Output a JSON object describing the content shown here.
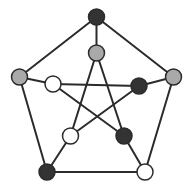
{
  "diagram": {
    "type": "graph",
    "name": "Petersen graph",
    "colors": {
      "edge": "#2b2b2b",
      "node_stroke": "#2b2b2b",
      "dark": "#333333",
      "gray": "#a9a9a9",
      "white": "#ffffff"
    },
    "node_radius": 8,
    "edge_width": 2,
    "nodes": [
      {
        "id": "outer-top",
        "x": 96.5,
        "y": 17,
        "fill": "dark"
      },
      {
        "id": "outer-right",
        "x": 173.5,
        "y": 77,
        "fill": "gray"
      },
      {
        "id": "outer-bottom-right",
        "x": 145,
        "y": 172,
        "fill": "white"
      },
      {
        "id": "outer-bottom-left",
        "x": 47,
        "y": 172,
        "fill": "dark"
      },
      {
        "id": "outer-left",
        "x": 19.5,
        "y": 77,
        "fill": "gray"
      },
      {
        "id": "inner-top",
        "x": 96.5,
        "y": 53,
        "fill": "gray"
      },
      {
        "id": "inner-right",
        "x": 139,
        "y": 86,
        "fill": "dark"
      },
      {
        "id": "inner-bottom-right",
        "x": 124,
        "y": 136,
        "fill": "dark"
      },
      {
        "id": "inner-bottom-left",
        "x": 70.5,
        "y": 136,
        "fill": "white"
      },
      {
        "id": "inner-left",
        "x": 53,
        "y": 84,
        "fill": "white"
      }
    ],
    "edges": [
      [
        "outer-top",
        "outer-right"
      ],
      [
        "outer-right",
        "outer-bottom-right"
      ],
      [
        "outer-bottom-right",
        "outer-bottom-left"
      ],
      [
        "outer-bottom-left",
        "outer-left"
      ],
      [
        "outer-left",
        "outer-top"
      ],
      [
        "outer-top",
        "inner-top"
      ],
      [
        "outer-right",
        "inner-right"
      ],
      [
        "outer-bottom-right",
        "inner-bottom-right"
      ],
      [
        "outer-bottom-left",
        "inner-bottom-left"
      ],
      [
        "outer-left",
        "inner-left"
      ],
      [
        "inner-top",
        "inner-bottom-left"
      ],
      [
        "inner-top",
        "inner-bottom-right"
      ],
      [
        "inner-left",
        "inner-right"
      ],
      [
        "inner-left",
        "inner-bottom-right"
      ],
      [
        "inner-right",
        "inner-bottom-left"
      ]
    ]
  }
}
